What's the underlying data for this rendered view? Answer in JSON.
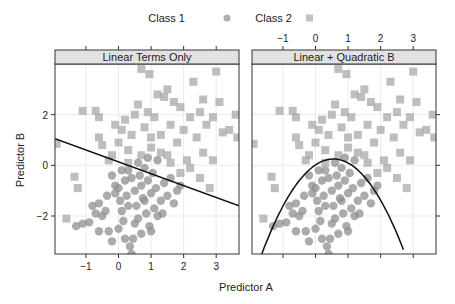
{
  "chart_data": {
    "type": "scatter",
    "title": "",
    "xlabel": "Predictor A",
    "ylabel": "Predictor B",
    "xlim": [
      -1.95,
      3.7
    ],
    "ylim": [
      -3.5,
      4.0
    ],
    "x_ticks": [
      -1,
      0,
      1,
      2,
      3
    ],
    "y_ticks": [
      -2,
      0,
      2
    ],
    "grid": true,
    "legend": {
      "position": "top",
      "entries": [
        {
          "label": "Class 1",
          "marker": "circle",
          "color": "#9a9a9a"
        },
        {
          "label": "Class 2",
          "marker": "square",
          "color": "#b3b3b3"
        }
      ]
    },
    "panels": [
      {
        "title": "Linear Terms Only",
        "boundary": {
          "type": "line",
          "points": [
            [
              -1.95,
              1.05
            ],
            [
              3.7,
              -1.6
            ]
          ]
        }
      },
      {
        "title": "Linear + Quadratic B",
        "boundary": {
          "type": "parabola",
          "vertex": [
            0.55,
            0.25
          ],
          "points": [
            [
              -1.65,
              -3.5
            ],
            [
              0.55,
              0.25
            ],
            [
              2.7,
              -3.5
            ]
          ]
        }
      }
    ],
    "series": [
      {
        "name": "Class 1",
        "marker": "circle",
        "points": [
          [
            -1.3,
            -2.4
          ],
          [
            -1.1,
            -2.3
          ],
          [
            -0.9,
            -2.25
          ],
          [
            -0.7,
            -1.9
          ],
          [
            -0.6,
            -1.5
          ],
          [
            -0.8,
            -1.6
          ],
          [
            -0.5,
            -2.0
          ],
          [
            -0.4,
            -1.8
          ],
          [
            -0.3,
            -2.6
          ],
          [
            -0.2,
            -3.0
          ],
          [
            -0.1,
            -1.1
          ],
          [
            0.0,
            -0.9
          ],
          [
            0.05,
            -1.4
          ],
          [
            0.1,
            -1.8
          ],
          [
            0.15,
            -2.2
          ],
          [
            0.2,
            -0.6
          ],
          [
            0.25,
            -1.2
          ],
          [
            0.3,
            -0.2
          ],
          [
            0.35,
            -3.2
          ],
          [
            0.4,
            -3.5
          ],
          [
            0.45,
            -2.9
          ],
          [
            0.5,
            -1.0
          ],
          [
            0.55,
            -1.6
          ],
          [
            0.6,
            -2.1
          ],
          [
            0.65,
            -0.4
          ],
          [
            0.7,
            -0.8
          ],
          [
            0.75,
            -1.3
          ],
          [
            0.8,
            -0.1
          ],
          [
            0.85,
            -1.9
          ],
          [
            0.9,
            -0.6
          ],
          [
            0.95,
            -2.4
          ],
          [
            1.0,
            -1.1
          ],
          [
            1.05,
            -0.3
          ],
          [
            1.1,
            -1.7
          ],
          [
            1.15,
            -0.9
          ],
          [
            1.2,
            -2.0
          ],
          [
            1.3,
            -1.4
          ],
          [
            1.4,
            -0.7
          ],
          [
            1.5,
            -1.2
          ],
          [
            1.6,
            -0.5
          ],
          [
            1.7,
            -1.5
          ],
          [
            1.8,
            -1.0
          ],
          [
            -0.2,
            -0.4
          ],
          [
            0.1,
            -0.2
          ],
          [
            0.4,
            -0.5
          ],
          [
            0.6,
            0.1
          ],
          [
            0.9,
            0.3
          ],
          [
            1.2,
            0.2
          ],
          [
            0.3,
            -1.6
          ],
          [
            0.7,
            -2.7
          ],
          [
            -0.6,
            -2.6
          ],
          [
            -0.35,
            -1.2
          ],
          [
            0.0,
            -2.5
          ],
          [
            0.5,
            -2.3
          ],
          [
            1.0,
            -2.6
          ],
          [
            0.2,
            -2.9
          ],
          [
            -0.1,
            -0.8
          ],
          [
            0.8,
            -1.4
          ],
          [
            1.35,
            -1.9
          ],
          [
            1.9,
            -0.8
          ]
        ]
      },
      {
        "name": "Class 2",
        "marker": "square",
        "points": [
          [
            -1.9,
            0.85
          ],
          [
            -1.6,
            -2.1
          ],
          [
            -1.35,
            -0.45
          ],
          [
            -1.25,
            -0.9
          ],
          [
            -1.1,
            2.15
          ],
          [
            -0.7,
            2.15
          ],
          [
            -0.6,
            1.9
          ],
          [
            -0.6,
            1.1
          ],
          [
            -0.5,
            0.8
          ],
          [
            -0.3,
            0.2
          ],
          [
            -0.1,
            1.6
          ],
          [
            0.0,
            0.9
          ],
          [
            0.1,
            1.4
          ],
          [
            0.2,
            1.8
          ],
          [
            0.3,
            0.6
          ],
          [
            0.4,
            1.2
          ],
          [
            0.5,
            2.0
          ],
          [
            0.6,
            2.4
          ],
          [
            0.7,
            3.8
          ],
          [
            0.8,
            1.5
          ],
          [
            0.9,
            2.1
          ],
          [
            0.95,
            3.6
          ],
          [
            1.0,
            0.7
          ],
          [
            1.1,
            1.9
          ],
          [
            1.2,
            2.8
          ],
          [
            1.3,
            1.2
          ],
          [
            1.4,
            2.7
          ],
          [
            1.5,
            3.0
          ],
          [
            1.6,
            1.6
          ],
          [
            1.7,
            2.5
          ],
          [
            1.8,
            0.9
          ],
          [
            1.9,
            2.3
          ],
          [
            2.0,
            1.4
          ],
          [
            2.1,
            0.2
          ],
          [
            2.2,
            1.9
          ],
          [
            2.3,
            3.3
          ],
          [
            2.4,
            1.1
          ],
          [
            2.5,
            2.1
          ],
          [
            2.6,
            0.5
          ],
          [
            2.7,
            1.6
          ],
          [
            2.8,
            -0.9
          ],
          [
            2.9,
            1.9
          ],
          [
            3.0,
            3.7
          ],
          [
            3.1,
            2.5
          ],
          [
            3.2,
            1.3
          ],
          [
            3.4,
            1.4
          ],
          [
            3.6,
            2.0
          ],
          [
            3.65,
            1.1
          ],
          [
            2.5,
            -0.5
          ],
          [
            1.9,
            -0.3
          ],
          [
            1.3,
            0.5
          ],
          [
            0.7,
            0.4
          ],
          [
            2.2,
            -0.1
          ],
          [
            1.6,
            0.1
          ],
          [
            2.9,
            0.2
          ],
          [
            0.3,
            0.1
          ],
          [
            -0.2,
            0.4
          ],
          [
            1.0,
            1.1
          ],
          [
            1.5,
            0.4
          ],
          [
            2.6,
            2.6
          ]
        ]
      }
    ]
  }
}
